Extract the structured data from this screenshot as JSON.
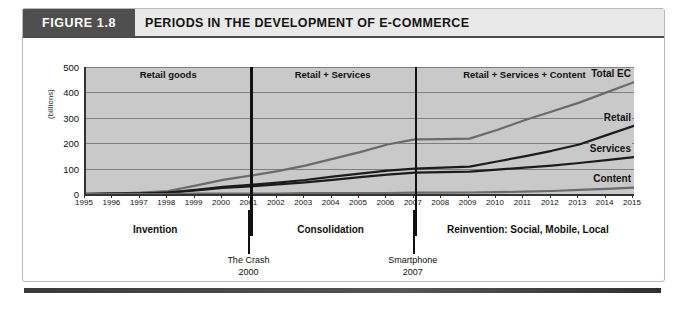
{
  "figure": {
    "tag": "FIGURE 1.8",
    "title": "PERIODS IN THE DEVELOPMENT OF E-COMMERCE"
  },
  "chart_data": {
    "type": "line",
    "title": "PERIODS IN THE DEVELOPMENT OF E-COMMERCE",
    "xlabel": "",
    "ylabel": "(billions)",
    "ylim": [
      0,
      500
    ],
    "yticks": [
      0,
      100,
      200,
      300,
      400,
      500
    ],
    "grid": true,
    "legend_position": "inline-right",
    "x": [
      1995,
      1996,
      1997,
      1998,
      1999,
      2000,
      2001,
      2002,
      2003,
      2004,
      2005,
      2006,
      2007,
      2008,
      2009,
      2010,
      2011,
      2012,
      2013,
      2014,
      2015
    ],
    "categories": [
      "1995",
      "1996",
      "1997",
      "1998",
      "1999",
      "2000",
      "2001",
      "2002",
      "2003",
      "2004",
      "2005",
      "2006",
      "2007",
      "2008",
      "2009",
      "2010",
      "2011",
      "2012",
      "2013",
      "2014",
      "2015"
    ],
    "series": [
      {
        "name": "Total EC",
        "color": "#6b6b6b",
        "values": [
          1,
          2,
          5,
          12,
          33,
          56,
          72,
          90,
          112,
          138,
          165,
          195,
          215,
          216,
          218,
          252,
          290,
          325,
          360,
          400,
          440
        ]
      },
      {
        "name": "Retail",
        "color": "#1c1c1c",
        "values": [
          0,
          1,
          2,
          6,
          16,
          28,
          36,
          45,
          55,
          68,
          80,
          92,
          100,
          104,
          108,
          128,
          148,
          170,
          195,
          232,
          268
        ]
      },
      {
        "name": "Services",
        "color": "#1c1c1c",
        "values": [
          0,
          1,
          2,
          5,
          14,
          24,
          30,
          38,
          46,
          56,
          66,
          76,
          84,
          86,
          88,
          96,
          104,
          112,
          122,
          133,
          145
        ]
      },
      {
        "name": "Content",
        "color": "#6b6b6b",
        "values": [
          0,
          0,
          0,
          0,
          1,
          1,
          2,
          2,
          3,
          3,
          4,
          4,
          5,
          5,
          6,
          7,
          9,
          12,
          16,
          20,
          25
        ]
      }
    ],
    "bands": [
      {
        "label": "Retail goods",
        "start": 1995,
        "end": 2001
      },
      {
        "label": "Retail + Services",
        "start": 2001,
        "end": 2007
      },
      {
        "label": "Retail + Services + Content",
        "start": 2007,
        "end": 2015
      }
    ],
    "dividers": [
      {
        "x": 2001
      },
      {
        "x": 2007
      }
    ],
    "phases": [
      {
        "label": "Invention",
        "center": 1997.6
      },
      {
        "label": "Consolidation",
        "center": 2004.0
      },
      {
        "label": "Reinvention: Social, Mobile, Local",
        "center": 2011.2
      }
    ],
    "events": [
      {
        "label": "The Crash",
        "sublabel": "2000",
        "x": 2001
      },
      {
        "label": "Smartphone",
        "sublabel": "2007",
        "x": 2007
      }
    ]
  }
}
